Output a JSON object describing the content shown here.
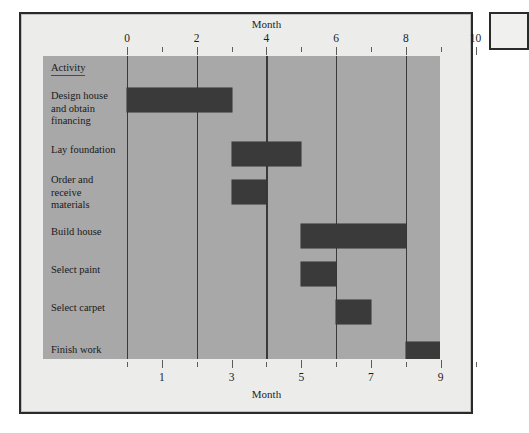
{
  "figure": {
    "background_color": "#ececea",
    "plot_background_color": "#a8a8a8",
    "bar_color": "#3a3a3a",
    "frame_color": "#2a2a2a"
  },
  "activity_header": "Activity",
  "axis": {
    "top_title": "Month",
    "bottom_title": "Month",
    "top_tick_labels": [
      "0",
      "2",
      "4",
      "6",
      "8",
      "10"
    ],
    "top_tick_values": [
      0,
      2,
      4,
      6,
      8,
      10
    ],
    "bottom_tick_labels": [
      "1",
      "3",
      "5",
      "7",
      "9"
    ],
    "bottom_tick_values": [
      1,
      3,
      5,
      7,
      9
    ],
    "minor_tick_values": [
      1,
      3,
      5,
      7,
      9
    ],
    "bottom_minor_tick_values": [
      0,
      2,
      4,
      6,
      8,
      10
    ],
    "gridline_values": [
      0,
      2,
      4,
      6,
      8
    ],
    "range": [
      0,
      10
    ]
  },
  "chart_data": {
    "type": "bar",
    "subtype": "gantt",
    "title": "",
    "xlabel": "Month",
    "ylabel": "Activity",
    "xlim": [
      0,
      10
    ],
    "grid": true,
    "legend": "none",
    "orientation": "horizontal",
    "categories": [
      "Design house and obtain financing",
      "Lay foundation",
      "Order and receive materials",
      "Build house",
      "Select paint",
      "Select carpet",
      "Finish work"
    ],
    "tasks": [
      {
        "label": "Design house\nand obtain\nfinancing",
        "name": "Design house and obtain financing",
        "start": 0,
        "end": 3,
        "duration": 3
      },
      {
        "label": "Lay foundation",
        "name": "Lay foundation",
        "start": 3,
        "end": 5,
        "duration": 2
      },
      {
        "label": "Order and\nreceive\nmaterials",
        "name": "Order and receive materials",
        "start": 3,
        "end": 4,
        "duration": 1
      },
      {
        "label": "Build house",
        "name": "Build house",
        "start": 5,
        "end": 8,
        "duration": 3
      },
      {
        "label": "Select paint",
        "name": "Select paint",
        "start": 5,
        "end": 6,
        "duration": 1
      },
      {
        "label": "Select carpet",
        "name": "Select carpet",
        "start": 6,
        "end": 7,
        "duration": 1
      },
      {
        "label": "Finish work",
        "name": "Finish work",
        "start": 8,
        "end": 9,
        "duration": 1
      }
    ]
  },
  "activity_labels": [
    {
      "lines": [
        "Design house",
        "and obtain",
        "financing"
      ]
    },
    {
      "lines": [
        "Lay foundation"
      ]
    },
    {
      "lines": [
        "Order and",
        "receive",
        "materials"
      ]
    },
    {
      "lines": [
        "Build house"
      ]
    },
    {
      "lines": [
        "Select paint"
      ]
    },
    {
      "lines": [
        "Select carpet"
      ]
    },
    {
      "lines": [
        "Finish work"
      ]
    }
  ]
}
